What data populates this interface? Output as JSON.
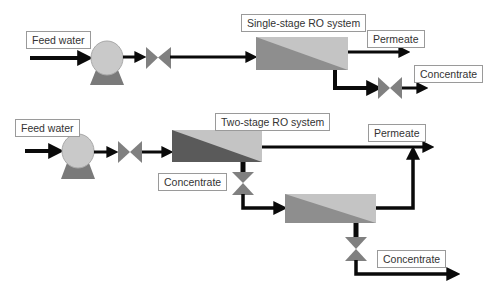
{
  "colors": {
    "line": "#0a0a0a",
    "pump_body": "#c9c9c9",
    "pump_outline": "#a8a8a8",
    "pump_base": "#7a7a7a",
    "valve": "#808080",
    "membrane_light": "#c4c4c4",
    "membrane_dark_single": "#8e8e8e",
    "membrane_dark_stage1": "#5a5a5a",
    "membrane_dark_stage2": "#8e8e8e",
    "label_border": "#9a9a9a",
    "label_text": "#333333"
  },
  "single_stage": {
    "title": "Single-stage RO system",
    "feed_label": "Feed water",
    "permeate_label": "Permeate",
    "concentrate_label": "Concentrate",
    "components": [
      "feed-line",
      "pump",
      "valve",
      "RO membrane",
      "permeate outlet",
      "concentrate valve",
      "concentrate outlet"
    ]
  },
  "two_stage": {
    "title": "Two-stage RO system",
    "feed_label": "Feed water",
    "permeate_label": "Permeate",
    "interstage_concentrate_label": "Concentrate",
    "final_concentrate_label": "Concentrate",
    "components": [
      "feed-line",
      "pump",
      "valve",
      "RO membrane stage 1",
      "interstage valve",
      "RO membrane stage 2",
      "combined permeate outlet",
      "concentrate valve",
      "concentrate outlet"
    ]
  }
}
